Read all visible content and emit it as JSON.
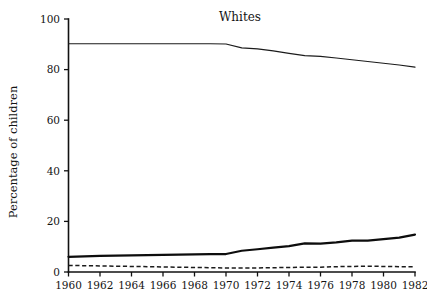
{
  "chart_data": {
    "type": "line",
    "title": "Whites",
    "xlabel": "",
    "ylabel": "Percentage of children",
    "xlim": [
      1960,
      1982
    ],
    "ylim": [
      0,
      100
    ],
    "grid": false,
    "legend": "none",
    "x": [
      1960,
      1961,
      1962,
      1963,
      1964,
      1965,
      1966,
      1967,
      1968,
      1969,
      1970,
      1971,
      1972,
      1973,
      1974,
      1975,
      1976,
      1977,
      1978,
      1979,
      1980,
      1981,
      1982
    ],
    "xticks": [
      1960,
      1962,
      1964,
      1966,
      1968,
      1970,
      1972,
      1974,
      1976,
      1978,
      1980,
      1982
    ],
    "xticklabels": [
      "1960",
      "1962",
      "1964",
      "1966",
      "1968",
      "1970",
      "1972",
      "1974",
      "1976",
      "1978",
      "1980",
      "1982"
    ],
    "yticks": [
      0,
      20,
      40,
      60,
      80,
      100
    ],
    "yticklabels": [
      "0",
      "20",
      "40",
      "60",
      "80",
      "100"
    ],
    "series": [
      {
        "name": "two-parent",
        "style": "solid-thin",
        "values": [
          90.2,
          90.2,
          90.2,
          90.2,
          90.2,
          90.2,
          90.2,
          90.2,
          90.2,
          90.2,
          90.1,
          88.6,
          88.2,
          87.4,
          86.4,
          85.5,
          85.2,
          84.6,
          83.9,
          83.2,
          82.5,
          81.8,
          81.0
        ]
      },
      {
        "name": "mother-only",
        "style": "solid-thick",
        "values": [
          6.0,
          6.2,
          6.4,
          6.5,
          6.6,
          6.7,
          6.8,
          6.9,
          7.0,
          7.1,
          7.1,
          8.4,
          9.0,
          9.6,
          10.2,
          11.3,
          11.2,
          11.7,
          12.4,
          12.4,
          13.0,
          13.6,
          14.8
        ]
      },
      {
        "name": "father-only-or-neither",
        "style": "dashed",
        "values": [
          2.6,
          2.5,
          2.4,
          2.3,
          2.2,
          2.1,
          2.0,
          1.9,
          1.8,
          1.7,
          1.6,
          1.6,
          1.6,
          1.7,
          1.8,
          1.9,
          1.9,
          2.1,
          2.2,
          2.3,
          2.2,
          2.1,
          2.1
        ]
      }
    ]
  },
  "figure": {
    "background_color": "#ffffff",
    "ink_color": "#111111"
  }
}
